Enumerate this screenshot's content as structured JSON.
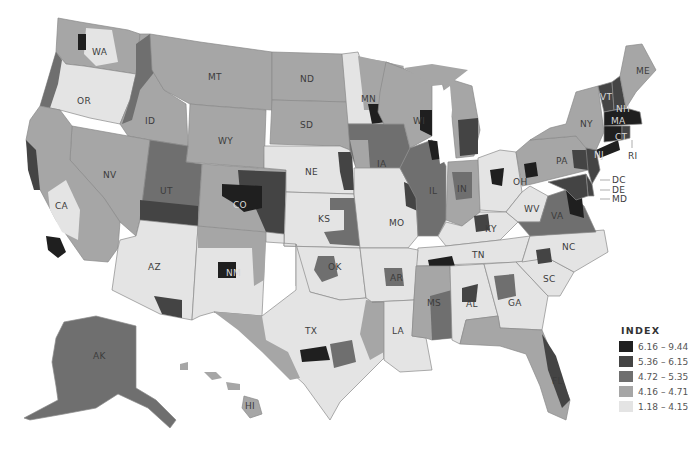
{
  "legend": {
    "title": "INDEX",
    "classes": [
      {
        "range": "6.16 – 9.44",
        "color": "#1f1f1f"
      },
      {
        "range": "5.36 – 6.15",
        "color": "#444444"
      },
      {
        "range": "4.72 – 5.35",
        "color": "#6f6f6f"
      },
      {
        "range": "4.16 – 4.71",
        "color": "#a6a6a6"
      },
      {
        "range": "1.18 – 4.15",
        "color": "#e4e4e4"
      }
    ]
  },
  "states": {
    "WA": "WA",
    "OR": "OR",
    "CA": "CA",
    "NV": "NV",
    "ID": "ID",
    "MT": "MT",
    "WY": "WY",
    "UT": "UT",
    "CO": "CO",
    "AZ": "AZ",
    "NM": "NM",
    "ND": "ND",
    "SD": "SD",
    "NE": "NE",
    "KS": "KS",
    "OK": "OK",
    "TX": "TX",
    "MN": "MN",
    "IA": "IA",
    "MO": "MO",
    "AR": "AR",
    "LA": "LA",
    "WI": "WI",
    "IL": "IL",
    "MI": "MI",
    "IN": "IN",
    "OH": "OH",
    "KY": "KY",
    "TN": "TN",
    "MS": "MS",
    "AL": "AL",
    "GA": "GA",
    "FL": "FL",
    "SC": "SC",
    "NC": "NC",
    "VA": "VA",
    "WV": "WV",
    "PA": "PA",
    "NY": "NY",
    "VT": "VT",
    "NH": "NH",
    "ME": "ME",
    "MA": "MA",
    "CT": "CT",
    "RI": "RI",
    "NJ": "NJ",
    "DE": "DE",
    "MD": "MD",
    "DC": "DC",
    "AK": "AK",
    "HI": "HI"
  }
}
